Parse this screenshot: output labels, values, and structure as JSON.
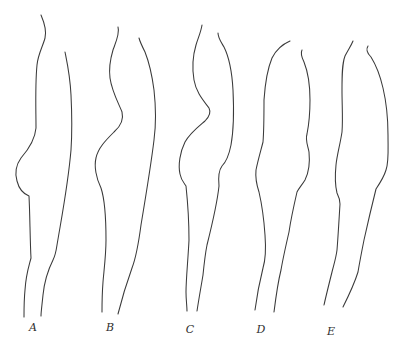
{
  "figure": {
    "background": "#ffffff",
    "stroke_color": "#3a3a3a",
    "panels": [
      {
        "label": "A",
        "label_pos": [
          33,
          327
        ],
        "left_outline": "M41,15 C44,22 47,30 45,38 C43,46 38,54 37,65 C35,85 36,110 36,128 C35,140 28,150 21,158 C16,165 15,174 17,181 C19,189 24,194 29,196 C30,215 30,240 31,258 C29,266 26,274 25,290 C24,300 24,310 24,317",
        "right_outline": "M65,52 C67,62 70,75 71,95 C72,115 72,135 71,150 C68,185 62,215 57,245 C56,252 55,256 53,260 C48,270 44,285 43,295 C42,305 41,312 41,316"
      },
      {
        "label": "B",
        "label_pos": [
          110,
          327
        ],
        "left_outline": "M118,27 C120,33 116,42 113,50 C110,60 109,70 110,78 C112,92 119,104 122,112 C124,120 121,126 114,132 C106,140 98,148 96,158 C94,166 96,178 101,188 C105,200 106,220 106,240 C106,255 104,270 103,282 C102,295 102,305 102,312",
        "right_outline": "M139,38 C140,42 142,46 145,52 C149,62 152,75 154,90 C156,108 156,125 154,140 C151,165 146,195 141,225 C139,240 137,255 132,268 C127,282 122,298 118,314"
      },
      {
        "label": "C",
        "label_pos": [
          190,
          329
        ],
        "left_outline": "M202,25 C201,32 198,38 196,45 C193,55 192,68 194,80 C196,92 203,100 209,108 C211,112 210,116 205,121 C198,127 190,133 185,142 C180,152 178,165 180,174 C181,180 184,183 186,186 C188,205 189,225 189,240 C188,260 186,280 186,292 C186,300 187,306 187,311",
        "right_outline": "M218,33 C218,38 221,42 224,47 C229,57 232,72 233,90 C234,110 234,128 231,145 C229,155 226,162 222,166 C219,170 218,176 219,186 C217,205 212,225 207,245 C205,255 204,265 203,275 C201,287 199,298 197,311"
      },
      {
        "label": "D",
        "label_pos": [
          261,
          329
        ],
        "left_outline": "M290,41 C283,44 276,50 272,58 C267,70 265,85 264,100 C264,115 264,130 263,142 C261,150 258,160 256,170 C255,180 257,186 259,192 C262,205 264,220 265,235 C266,248 266,258 263,268 C260,280 257,295 255,310",
        "right_outline": "M302,50 C300,54 302,58 304,62 C308,72 310,85 310,100 C310,112 309,124 307,134 C305,140 308,146 309,152 C310,162 309,172 305,180 C302,185 299,188 297,192 C294,205 291,218 289,232 C286,245 283,258 281,270 C278,282 276,296 274,312"
      },
      {
        "label": "E",
        "label_pos": [
          331,
          331
        ],
        "left_outline": "M353,41 C351,46 348,50 345,56 C342,64 342,75 342,90 C342,105 343,120 342,132 C340,145 337,155 336,165 C335,175 335,185 337,193 C339,197 340,200 340,204 C339,220 338,238 337,250 C336,258 334,264 332,272 C329,284 326,296 324,305",
        "right_outline": "M368,46 C366,49 367,53 371,57 C376,65 380,75 383,88 C387,105 388,120 388,135 C388,150 389,162 386,170 C384,177 380,183 376,189 C372,205 368,222 364,240 C362,250 360,260 358,272 C354,285 348,297 343,307"
      }
    ]
  }
}
